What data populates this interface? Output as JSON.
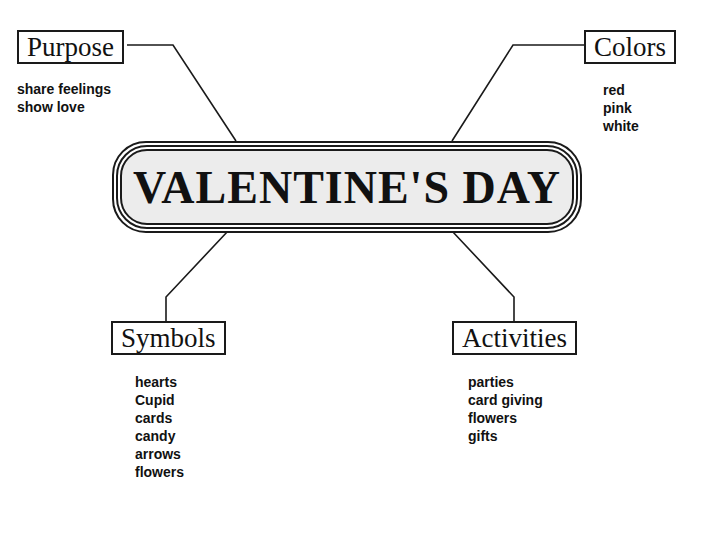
{
  "center": {
    "title": "VALENTINE'S DAY"
  },
  "nodes": {
    "purpose": {
      "label": "Purpose",
      "items": [
        "share feelings",
        "show love"
      ]
    },
    "colors": {
      "label": "Colors",
      "items": [
        "red",
        "pink",
        "white"
      ]
    },
    "symbols": {
      "label": "Symbols",
      "items": [
        "hearts",
        "Cupid",
        "cards",
        "candy",
        "arrows",
        "flowers"
      ]
    },
    "activities": {
      "label": "Activities",
      "items": [
        "parties",
        "card giving",
        "flowers",
        "gifts"
      ]
    }
  }
}
